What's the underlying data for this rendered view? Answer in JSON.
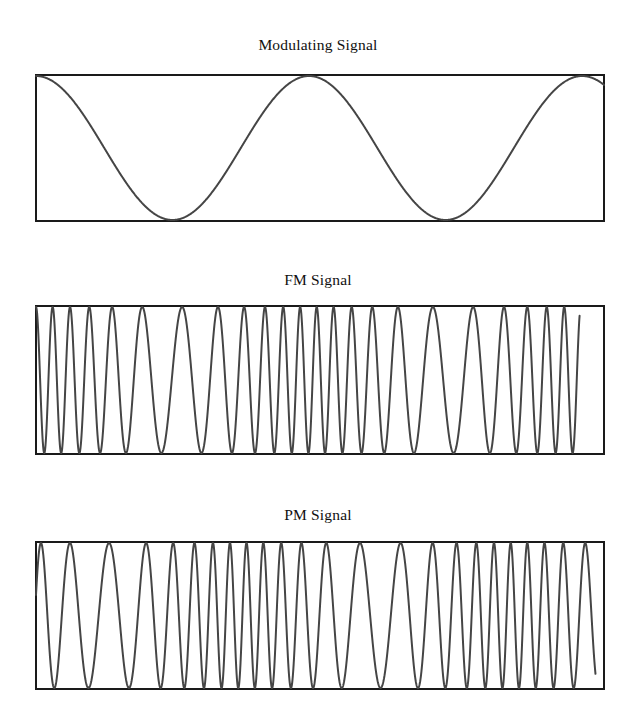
{
  "figure": {
    "background_color": "#ffffff",
    "frame_color": "#1a1a1a",
    "curve_color": "#454545"
  },
  "panels": [
    {
      "id": "modulating",
      "title": "Modulating Signal",
      "title_x": 0,
      "title_y": 36,
      "box": {
        "x": 35,
        "y": 74,
        "width": 570,
        "height": 148
      }
    },
    {
      "id": "fm",
      "title": "FM Signal",
      "title_x": 0,
      "title_y": 271,
      "box": {
        "x": 35,
        "y": 305,
        "width": 570,
        "height": 150
      }
    },
    {
      "id": "pm",
      "title": "PM Signal",
      "title_x": 0,
      "title_y": 506,
      "box": {
        "x": 35,
        "y": 541,
        "width": 570,
        "height": 149
      }
    }
  ],
  "chart_data": [
    {
      "type": "line",
      "id": "modulating",
      "title": "Modulating Signal",
      "xlabel": "",
      "ylabel": "",
      "grid": false,
      "legend": "none",
      "xlim": [
        0,
        2.08
      ],
      "ylim": [
        -1,
        1
      ],
      "description": "Cosine modulating wave, amplitude 1, about two full cycles across the frame, starting at positive peak at the left edge.",
      "waveform": "cosine",
      "amplitude": 1,
      "cycles": 2.08,
      "phase_deg": 0,
      "series": [
        {
          "name": "m(t)",
          "x": [
            0,
            0.125,
            0.25,
            0.375,
            0.5,
            0.625,
            0.75,
            0.875,
            1.0,
            1.125,
            1.25,
            1.375,
            1.5,
            1.625,
            1.75,
            1.875,
            2.0,
            2.08
          ],
          "values": [
            1.0,
            0.707,
            0.0,
            -0.707,
            -1.0,
            -0.707,
            0.0,
            0.707,
            1.0,
            0.707,
            0.0,
            -0.707,
            -1.0,
            -0.707,
            0.0,
            0.707,
            1.0,
            0.876
          ]
        }
      ]
    },
    {
      "type": "line",
      "id": "fm",
      "title": "FM Signal",
      "xlabel": "",
      "ylabel": "",
      "grid": false,
      "legend": "none",
      "xlim": [
        0,
        2.08
      ],
      "ylim": [
        -1,
        1
      ],
      "description": "Frequency-modulated carrier. Instantaneous frequency is proportional to the modulating signal amplitude: highest where the modulating cosine peaks (frame left edge, centre, right edge) and lowest at the modulating troughs.",
      "carrier_cycles": 24,
      "modulation_index": 5.0,
      "amplitude": 1,
      "instantaneous_frequency_rule": "f(t) = fc + kf * m(t)",
      "approx_cycle_count": 24
    },
    {
      "type": "line",
      "id": "pm",
      "title": "PM Signal",
      "xlabel": "",
      "ylabel": "",
      "grid": false,
      "legend": "none",
      "xlim": [
        0,
        2.08
      ],
      "ylim": [
        -1,
        1
      ],
      "description": "Phase-modulated carrier. Instantaneous frequency follows the derivative of the modulating signal, so the fastest oscillation is shifted a quarter cycle relative to the FM trace.",
      "carrier_cycles": 24,
      "modulation_index": 5.0,
      "amplitude": 1,
      "instantaneous_frequency_rule": "f(t) = fc + kp * dm(t)/dt",
      "approx_cycle_count": 24
    }
  ]
}
